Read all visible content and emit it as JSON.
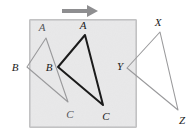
{
  "figure": {
    "canvas": {
      "width": 196,
      "height": 132
    },
    "colors": {
      "background": "#ffffff",
      "box_fill": "#ececed",
      "box_stroke": "#9a9a9c",
      "gray_stroke": "#9a9a9c",
      "dark_stroke": "#1b1b1b",
      "arrow": "#8e8e90",
      "label_dark": "#1b1b1b",
      "label_gray": "#55565a"
    },
    "box": {
      "x": 30,
      "y": 20,
      "width": 106,
      "height": 107
    },
    "arrow": {
      "name": "translation-arrow",
      "x1": 62,
      "y1": 11,
      "x2": 98,
      "y2": 11,
      "direction": "right"
    },
    "shapes": [
      {
        "name": "triangle-abc-preimage",
        "style": "gray",
        "points": "46,38 27,67 68,102",
        "vertices": [
          {
            "label": "A",
            "x": 46,
            "y": 38,
            "label_x": 42,
            "label_y": 27
          },
          {
            "label": "B",
            "x": 27,
            "y": 67,
            "label_x": 15,
            "label_y": 67
          },
          {
            "label": "C",
            "x": 68,
            "y": 102,
            "label_x": 70,
            "label_y": 114
          }
        ]
      },
      {
        "name": "triangle-abc-image",
        "style": "dark",
        "points": "85,35 58,67 103,105",
        "vertices": [
          {
            "label": "A",
            "x": 85,
            "y": 35,
            "label_x": 83,
            "label_y": 25
          },
          {
            "label": "B",
            "x": 58,
            "y": 67,
            "label_x": 49,
            "label_y": 67
          },
          {
            "label": "C",
            "x": 103,
            "y": 105,
            "label_x": 106,
            "label_y": 116
          }
        ]
      },
      {
        "name": "triangle-xyz",
        "style": "gray",
        "points": "160,32 127,68 178,110",
        "vertices": [
          {
            "label": "X",
            "x": 160,
            "y": 32,
            "label_x": 158,
            "label_y": 22
          },
          {
            "label": "Y",
            "x": 127,
            "y": 68,
            "label_x": 120,
            "label_y": 66
          },
          {
            "label": "Z",
            "x": 178,
            "y": 110,
            "label_x": 182,
            "label_y": 120
          }
        ]
      }
    ],
    "labels": [
      {
        "name": "vertex-label-a-preimage",
        "text": "A",
        "x": 42,
        "y": 27,
        "tone": "gray"
      },
      {
        "name": "vertex-label-b-preimage",
        "text": "B",
        "x": 15,
        "y": 67,
        "tone": "dark"
      },
      {
        "name": "vertex-label-c-preimage",
        "text": "C",
        "x": 70,
        "y": 114,
        "tone": "gray"
      },
      {
        "name": "vertex-label-a-image",
        "text": "A",
        "x": 83,
        "y": 25,
        "tone": "dark"
      },
      {
        "name": "vertex-label-b-image",
        "text": "B",
        "x": 49,
        "y": 67,
        "tone": "dark"
      },
      {
        "name": "vertex-label-c-image",
        "text": "C",
        "x": 106,
        "y": 116,
        "tone": "dark"
      },
      {
        "name": "vertex-label-x",
        "text": "X",
        "x": 158,
        "y": 22,
        "tone": "dark"
      },
      {
        "name": "vertex-label-y",
        "text": "Y",
        "x": 120,
        "y": 66,
        "tone": "dark"
      },
      {
        "name": "vertex-label-z",
        "text": "Z",
        "x": 182,
        "y": 120,
        "tone": "dark"
      }
    ]
  }
}
